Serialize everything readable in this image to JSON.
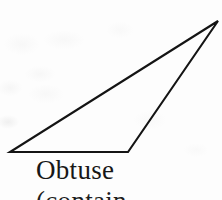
{
  "figure": {
    "name": "obtuse-triangle-figure",
    "background_color": "#fdfdfd",
    "stroke_color": "#141414",
    "stroke_width": 2.1,
    "width": 222,
    "height": 200
  },
  "shape": {
    "type": "triangle",
    "classification": "obtuse",
    "vertices": [
      {
        "label": "bottom-left",
        "x": 10,
        "y": 152
      },
      {
        "label": "bottom-right",
        "x": 128,
        "y": 152
      },
      {
        "label": "apex-right",
        "x": 218,
        "y": 21
      }
    ],
    "polygon_points": "10,152 128,152 218,21"
  },
  "caption": {
    "line1": "Obtuse",
    "line2": "(contain",
    "line2_clipped": true
  }
}
